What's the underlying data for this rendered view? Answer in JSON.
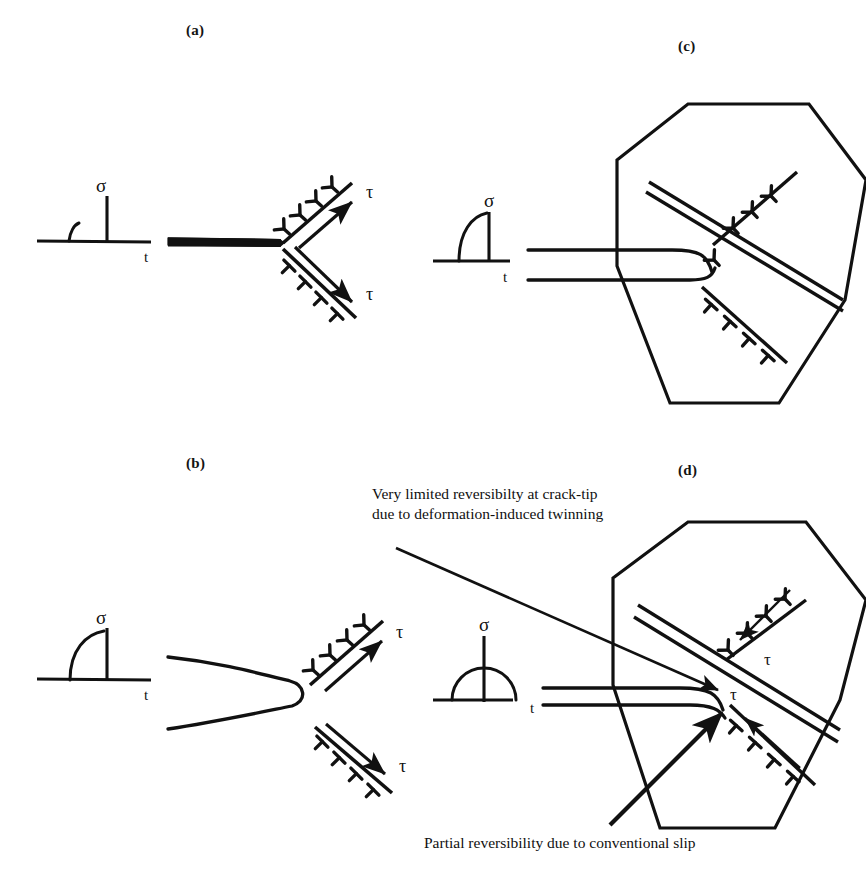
{
  "figure": {
    "background_color": "#ffffff",
    "ink_color": "#111111",
    "width": 866,
    "height": 871
  },
  "panels": [
    {
      "id": "a",
      "label": "(a)",
      "label_x": 196,
      "label_y": 30,
      "description": "Monotonic loading: sharp crack with slip bands emitting dislocations at crack tip",
      "loading": {
        "stress_symbol": "σ",
        "time_symbol": "t",
        "waveform": "monotonic-ramp-hold"
      },
      "crack": {
        "tip_shape": "sharp",
        "type": "slit"
      },
      "slip_bands": [
        {
          "position": "upper",
          "shear_symbol": "τ",
          "dislocation_glyph": "inverted-tee",
          "dislocation_count": 4,
          "arrow_direction": "up-right"
        },
        {
          "position": "lower",
          "shear_symbol": "τ",
          "dislocation_glyph": "upright-tee",
          "dislocation_count": 4,
          "arrow_direction": "down-right"
        }
      ]
    },
    {
      "id": "b",
      "label": "(b)",
      "label_x": 196,
      "label_y": 463,
      "description": "Cyclic loading: blunted crack tip with slip bands emitting dislocations",
      "loading": {
        "stress_symbol": "σ",
        "time_symbol": "t",
        "waveform": "cyclic-half-cycle"
      },
      "crack": {
        "tip_shape": "blunted",
        "type": "wedge"
      },
      "slip_bands": [
        {
          "position": "upper",
          "shear_symbol": "τ",
          "dislocation_glyph": "inverted-tee",
          "dislocation_count": 4,
          "arrow_direction": "up-right"
        },
        {
          "position": "lower",
          "shear_symbol": "τ",
          "dislocation_glyph": "upright-tee",
          "dislocation_count": 4,
          "arrow_direction": "down-right"
        }
      ]
    },
    {
      "id": "c",
      "label": "(c)",
      "label_x": 688,
      "label_y": 46,
      "description": "Monotonic loading inside a hexagonal grain: deformation twin band crosses the grain, dislocation pile-ups on slip planes",
      "loading": {
        "stress_symbol": "σ",
        "time_symbol": "t",
        "waveform": "monotonic-ramp-hold"
      },
      "grain": {
        "shape": "hexagon",
        "sides": 6
      },
      "twin_band": {
        "style": "double-line",
        "orientation": "upper-left-to-lower-right"
      },
      "slip_bands": [
        {
          "position": "upper",
          "dislocation_glyph": "inverted-tee",
          "dislocation_count": 4
        },
        {
          "position": "lower",
          "dislocation_glyph": "upright-tee",
          "dislocation_count": 4
        }
      ]
    },
    {
      "id": "d",
      "label": "(d)",
      "label_x": 688,
      "label_y": 470,
      "description": "Cyclic loading inside a hexagonal grain: twin band at crack tip with reversed shear arrows",
      "loading": {
        "stress_symbol": "σ",
        "time_symbol": "t",
        "waveform": "cyclic-half-cycle"
      },
      "grain": {
        "shape": "hexagon",
        "sides": 6
      },
      "twin_band": {
        "style": "double-line",
        "orientation": "upper-left-to-lower-right"
      },
      "slip_bands": [
        {
          "position": "upper",
          "shear_symbol": "τ",
          "dislocation_glyph": "inverted-tee",
          "dislocation_count": 4,
          "arrow_direction": "toward-crack-tip"
        },
        {
          "position": "lower",
          "shear_symbol": "τ",
          "dislocation_glyph": "upright-tee",
          "dislocation_count": 4,
          "arrow_direction": "toward-crack-tip"
        }
      ]
    }
  ],
  "annotations": {
    "top": {
      "line1": "Very limited reversibilty at crack-tip",
      "line2": "due to deformation-induced twinning",
      "x": 372,
      "y": 485,
      "leader": "arrow pointing down-right to crack tip"
    },
    "bottom": {
      "line1": "Partial reversibility due to conventional slip",
      "x": 424,
      "y": 832,
      "leader": "thick arrow pointing up-right to crack tip"
    }
  },
  "symbols": {
    "sigma": "σ",
    "tau": "τ",
    "time": "t"
  }
}
